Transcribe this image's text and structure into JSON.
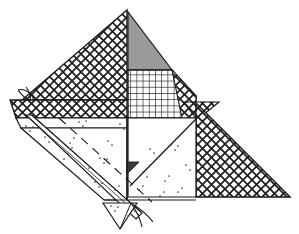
{
  "figure": {
    "title": "Geometric hatched polygon line drawing",
    "canvas": {
      "width": 299,
      "height": 234,
      "background": "#ffffff"
    },
    "colors": {
      "ink": "#1a1a1a",
      "stroke": "#2b2b2b",
      "gray_fill": "#9a9a9a",
      "dark_fill": "#3a3a3a",
      "white_fill": "#ffffff",
      "stipple": "#4a4a4a",
      "hatch_line": "#1f1f1f"
    },
    "regions": [
      {
        "id": "left-crosshatch-triangle",
        "label": "Left diagonal cross-hatched triangle",
        "fill": "crosshatch-diagonal",
        "points": "127,10 127,100 22,100"
      },
      {
        "id": "gray-triangle",
        "label": "Gray filled triangle at apex right",
        "fill": "solid-gray",
        "points": "128,12 128,70 172,70"
      },
      {
        "id": "fine-grid-rect",
        "label": "Fine square grid quadrilateral",
        "fill": "grid-fine",
        "points": "128,70 172,70 196,96 196,118 128,118"
      },
      {
        "id": "upper-right-crosshatch-wedge",
        "label": "Upper right cross-hatch wedge above notch",
        "fill": "crosshatch-diagonal",
        "points": "172,70 196,96 196,118"
      },
      {
        "id": "right-crosshatch-triangle",
        "label": "Right large cross-hatched right triangle",
        "fill": "crosshatch-diagonal",
        "points": "196,103 290,197 196,197"
      },
      {
        "id": "right-notch-wedge",
        "label": "Notch wedge at top of right triangle",
        "fill": "crosshatch-diagonal",
        "points": "186,103 218,103 196,119"
      },
      {
        "id": "left-horizontal-crosshatch-band",
        "label": "Left horizontal cross-hatched band",
        "fill": "crosshatch-diagonal",
        "points": "10,100 127,100 127,118 16,118"
      },
      {
        "id": "left-white-band",
        "label": "Left white band below hatched band",
        "fill": "white",
        "points": "16,118 127,118 127,128 21,128"
      },
      {
        "id": "left-stipple-triangle",
        "label": "Left stippled triangle body",
        "fill": "stipple",
        "points": "21,128 127,128 127,200 104,200"
      },
      {
        "id": "center-stipple-square",
        "label": "Center stippled quadrilateral with diagonal",
        "fill": "stipple",
        "points": "128,118 196,118 196,197 128,197"
      },
      {
        "id": "center-dark-triangle",
        "label": "Small dark triangle on center left edge",
        "fill": "solid-dark",
        "points": "127,162 138,162 127,173"
      },
      {
        "id": "bottom-pennant",
        "label": "Bottom V-shaped pennant below diagonal band",
        "fill": "white",
        "points": "103,203 136,203 120,228"
      }
    ],
    "diagonal_band": {
      "label": "Long diagonal double-line band",
      "start": "28,118",
      "end": "138,214",
      "width": 7
    },
    "dashed_line": {
      "label": "Dashed construction line parallel to band",
      "start": "60,118",
      "end": "150,200"
    },
    "center_diagonal": {
      "label": "Diagonal edge inside center square",
      "start": "130,185",
      "end": "196,119"
    },
    "leaf_top_left": {
      "label": "Small leaf curl at upper left of band",
      "anchor": "30,100"
    },
    "stem_bottom": {
      "label": "Curved stem strands at bottom center",
      "anchor": "134,205"
    },
    "stipple_dots": [
      [
        26,
        126
      ],
      [
        30,
        131
      ],
      [
        33,
        127
      ],
      [
        79,
        122
      ],
      [
        83,
        126
      ],
      [
        86,
        121
      ],
      [
        120,
        124
      ],
      [
        124,
        129
      ],
      [
        45,
        137
      ],
      [
        49,
        142
      ],
      [
        70,
        143
      ],
      [
        74,
        138
      ],
      [
        72,
        148
      ],
      [
        108,
        141
      ],
      [
        112,
        145
      ],
      [
        64,
        159
      ],
      [
        68,
        154
      ],
      [
        100,
        158
      ],
      [
        104,
        163
      ],
      [
        107,
        159
      ],
      [
        57,
        177
      ],
      [
        61,
        172
      ],
      [
        95,
        182
      ],
      [
        99,
        187
      ],
      [
        102,
        183
      ],
      [
        115,
        190
      ],
      [
        119,
        186
      ],
      [
        40,
        160
      ],
      [
        44,
        165
      ],
      [
        89,
        168
      ],
      [
        150,
        149
      ],
      [
        154,
        153
      ],
      [
        171,
        145
      ],
      [
        175,
        150
      ],
      [
        178,
        146
      ],
      [
        143,
        172
      ],
      [
        147,
        177
      ],
      [
        165,
        181
      ],
      [
        169,
        176
      ],
      [
        186,
        165
      ],
      [
        190,
        170
      ],
      [
        139,
        190
      ],
      [
        143,
        186
      ],
      [
        178,
        192
      ],
      [
        182,
        188
      ],
      [
        160,
        196
      ],
      [
        164,
        192
      ],
      [
        111,
        206
      ],
      [
        115,
        211
      ],
      [
        118,
        207
      ],
      [
        128,
        216
      ]
    ],
    "outline_notes": {
      "apex": "127,10",
      "left_base": "22,100",
      "right_base": "290,197"
    }
  }
}
